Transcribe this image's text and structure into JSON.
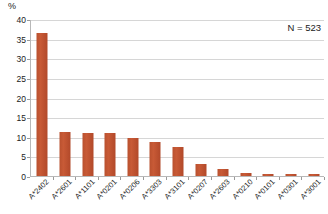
{
  "chart_data": {
    "type": "bar",
    "title": "",
    "xlabel": "",
    "ylabel": "%",
    "ylim": [
      0,
      40
    ],
    "ytick_step": 5,
    "yticks": [
      "0",
      "5",
      "10",
      "15",
      "20",
      "25",
      "30",
      "35",
      "40"
    ],
    "grid": true,
    "legend": "none",
    "bar_color": "#c0502f",
    "categories": [
      "A*2402",
      "A*2601",
      "A*1101",
      "A*0201",
      "A*0206",
      "A*3303",
      "A*3101",
      "A*0207",
      "A*2603",
      "A*0210",
      "A*0101",
      "A*0301",
      "A*3001"
    ],
    "values": [
      36.5,
      11.2,
      11.0,
      10.9,
      9.6,
      8.6,
      7.4,
      3.0,
      1.9,
      0.8,
      0.6,
      0.6,
      0.5
    ],
    "annotations": [
      {
        "text": "N = 523",
        "position": "top-right"
      }
    ]
  },
  "axis": {
    "y_title": "%"
  },
  "annotation": {
    "n_label": "N = 523"
  }
}
